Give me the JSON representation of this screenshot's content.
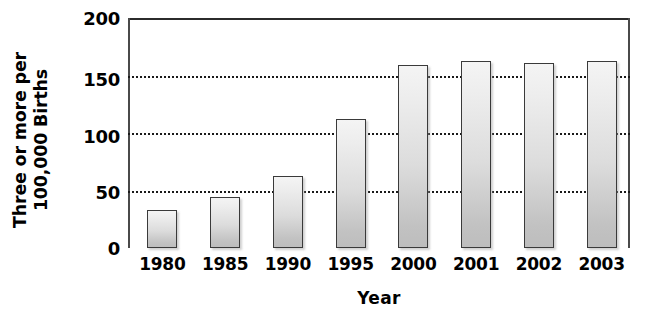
{
  "chart_data": {
    "type": "bar",
    "title": "",
    "xlabel": "Year",
    "ylabel": "Three or more per 100,000 Births",
    "ylabel_lines": [
      "Three or more per",
      "100,000 Births"
    ],
    "categories": [
      "1980",
      "1985",
      "1990",
      "1995",
      "2000",
      "2001",
      "2002",
      "2003"
    ],
    "values": [
      33,
      44,
      63,
      112,
      159,
      163,
      161,
      163
    ],
    "ylim": [
      0,
      200
    ],
    "yticks": [
      0,
      50,
      100,
      150,
      200
    ],
    "ytick_labels": [
      "0",
      "50",
      "100",
      "150",
      "200"
    ],
    "grid": "horizontal-dotted",
    "legend": "none",
    "bar_border_color": "#3a3a3a",
    "bar_fill_top_color": "#f4f4f4",
    "bar_fill_bottom_color": "#bdbdbd",
    "gridline_color": "#1a1a1a",
    "axis_color": "#4a4a4a",
    "background_color": "#ffffff"
  }
}
